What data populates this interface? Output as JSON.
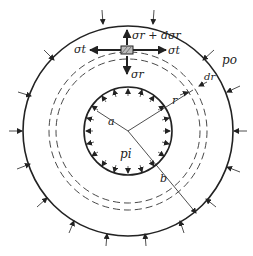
{
  "diagram": {
    "labels": {
      "sigma_r_plus": "σr + dσr",
      "sigma_r": "σr",
      "sigma_t_left": "σt",
      "sigma_t_right": "σt",
      "p_o": "po",
      "p_i": "pi",
      "r": "r",
      "dr": "dr",
      "a": "a",
      "b": "b"
    },
    "geometry": {
      "center": [
        128,
        131
      ],
      "outer_radius": 105,
      "inner_radius": 44,
      "dashed_radii": [
        72,
        79
      ]
    },
    "colors": {
      "stroke": "#222222",
      "background": "#ffffff"
    }
  }
}
